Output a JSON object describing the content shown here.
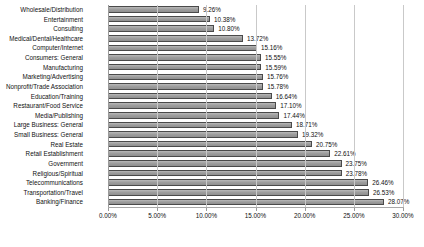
{
  "chart_data": {
    "type": "bar",
    "orientation": "horizontal",
    "title": "",
    "subtitle": "",
    "xlabel": "",
    "ylabel": "",
    "xlim": [
      0,
      30
    ],
    "xtick_labels": [
      "0.00%",
      "5.00%",
      "10.00%",
      "15.00%",
      "20.00%",
      "25.00%",
      "30.00%"
    ],
    "xtick_values": [
      0,
      5,
      10,
      15,
      20,
      25,
      30
    ],
    "grid": "vertical",
    "legend": "none",
    "bar_color": "#9e9e9e",
    "bar_border_color": "#4a4a4a",
    "background_color": "#ffffff",
    "gridline_color": "#c9c9c9",
    "categories": [
      "Wholesale/Distribution",
      "Entertainment",
      "Consulting",
      "Medical/Dental/Healthcare",
      "Computer/Internet",
      "Consumers: General",
      "Manufacturing",
      "Marketing/Advertising",
      "Nonprofit/Trade Association",
      "Education/Training",
      "Restaurant/Food Service",
      "Media/Publishing",
      "Large Business: General",
      "Small Business: General",
      "Real Estate",
      "Retail Establishment",
      "Government",
      "Religious/Spiritual",
      "Telecommunications",
      "Transportation/Travel",
      "Banking/Finance"
    ],
    "values": [
      9.26,
      10.38,
      10.8,
      13.72,
      15.16,
      15.55,
      15.59,
      15.76,
      15.78,
      16.64,
      17.1,
      17.44,
      18.71,
      19.32,
      20.75,
      22.61,
      23.75,
      23.78,
      26.46,
      26.53,
      28.07
    ],
    "data_labels": [
      "9.26%",
      "10.38%",
      "10.80%",
      "13.72%",
      "15.16%",
      "15.55%",
      "15.59%",
      "15.76%",
      "15.78%",
      "16.64%",
      "17.10%",
      "17.44%",
      "18.71%",
      "19.32%",
      "20.75%",
      "22.61%",
      "23.75%",
      "23.78%",
      "26.46%",
      "26.53%",
      "28.07%"
    ]
  }
}
